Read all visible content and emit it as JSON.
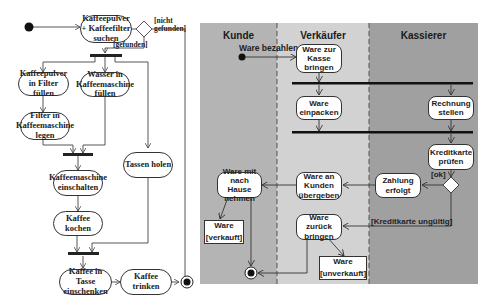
{
  "left_diagram": {
    "actions": {
      "search": "Kaffeepulver\n+ Kaffeefilter\nsuchen",
      "powder_in_filter": "Kaffeepulver\nin Filter füllen",
      "filter_in_machine": "Filter in\nKaffeemaschine\nlegen",
      "water_in_machine": "Wasser in\nKaffeemaschine\nfüllen",
      "get_cups": "Tassen holen",
      "switch_on": "Kaffeemaschine\neinschalten",
      "brew": "Kaffee kochen",
      "pour": "Kaffee in Tasse\neinschenken",
      "drink": "Kaffee trinken"
    },
    "guards": {
      "not_found": "[nicht\ngefunden]",
      "found": "[gefunden]"
    }
  },
  "right_diagram": {
    "colors": {
      "kunde_lane": "#b4b4b4",
      "verkaeufer_lane": "#d2d2d2",
      "kassierer_lane": "#a0a0a0"
    },
    "lanes": [
      "Kunde",
      "Verkäufer",
      "Kassierer"
    ],
    "start_label": "Ware bezahlen",
    "actions": {
      "bring_to_register": "Ware zur\nKasse\nbringen",
      "pack": "Ware\neinpacken",
      "invoice": "Rechnung\nstellen",
      "check_card": "Kreditkarte\nprüfen",
      "payment_done": "Zahlung\nerfolgt",
      "hand_over": "Ware an\nKunden\nübergeben",
      "take_home": "Ware mit\nnach Hause\nnehmen",
      "return_goods": "Ware\nzurück\nbringen"
    },
    "objects": {
      "sold": {
        "name": "Ware",
        "state": "[verkauft]"
      },
      "unsold": {
        "name": "Ware",
        "state": "[unverkauft]"
      }
    },
    "guards": {
      "ok": "[ok]",
      "card_invalid": "[Kreditkarte ungültig]"
    }
  }
}
